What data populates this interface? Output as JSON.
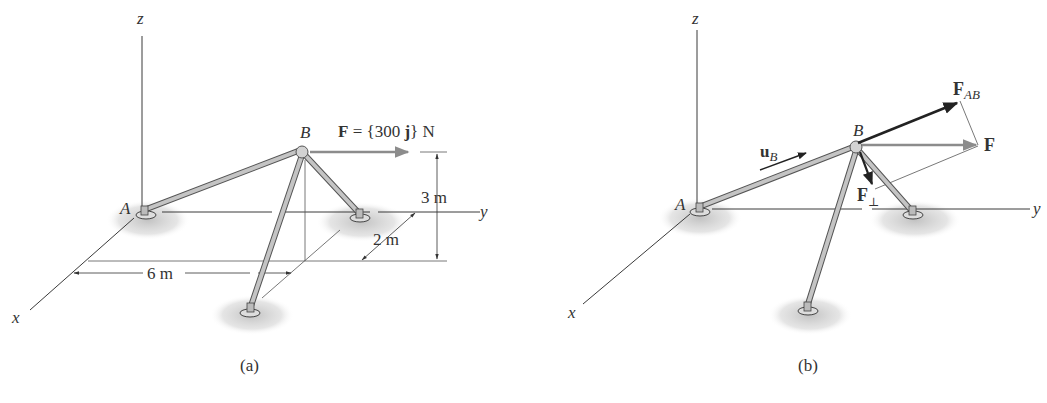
{
  "figure": {
    "panels": [
      {
        "id": "a",
        "caption": "(a)",
        "axes": {
          "x": "x",
          "y": "y",
          "z": "z"
        },
        "points": {
          "A": "A",
          "B": "B"
        },
        "force_label": {
          "symbol": "F",
          "equals": " = {300 ",
          "unit_vector": "j",
          "tail": "} N"
        },
        "dimensions": {
          "height": "3 m",
          "depth": "2 m",
          "width": "6 m"
        }
      },
      {
        "id": "b",
        "caption": "(b)",
        "axes": {
          "x": "x",
          "y": "y",
          "z": "z"
        },
        "points": {
          "A": "A",
          "B": "B"
        },
        "vectors": {
          "F": "F",
          "F_AB_main": "F",
          "F_AB_sub": "AB",
          "F_perp_main": "F",
          "F_perp_sub": "⊥",
          "u_B_main": "u",
          "u_B_sub": "B"
        }
      }
    ],
    "colors": {
      "line": "#3a3a3a",
      "member_fill": "#bdbdbd",
      "member_edge": "#555555",
      "force_gray": "#8c8c8c",
      "force_dark": "#222222",
      "ground_shadow": "#c8c8c8"
    }
  }
}
